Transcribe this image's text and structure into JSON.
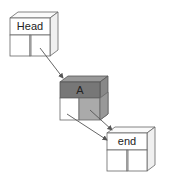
{
  "diagram": {
    "type": "linked-list",
    "nodes": [
      {
        "id": "head",
        "label": "Head",
        "style": "light"
      },
      {
        "id": "a",
        "label": "A",
        "style": "dark"
      },
      {
        "id": "end",
        "label": "end",
        "style": "light"
      }
    ],
    "edges": [
      {
        "from": "head",
        "to": "a"
      },
      {
        "from": "a",
        "to": "end"
      },
      {
        "from": "a",
        "to": "end"
      }
    ],
    "colors": {
      "light_face": "#ffffff",
      "light_side": "#f2f2f2",
      "dark_face": "#777777",
      "dark_top": "#999999",
      "dark_cell": "#aaaaaa",
      "stroke": "#555555"
    }
  }
}
